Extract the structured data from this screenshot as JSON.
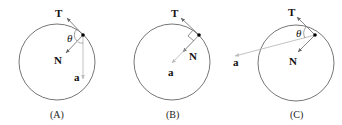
{
  "diagrams": [
    {
      "caption": "(A)",
      "labels": {
        "tension": "T",
        "normal": "N",
        "acceleration": "a",
        "angle": "θ"
      }
    },
    {
      "caption": "(B)",
      "labels": {
        "tension": "T",
        "normal": "N",
        "acceleration": "a"
      }
    },
    {
      "caption": "(C)",
      "labels": {
        "tension": "T",
        "normal": "N",
        "acceleration": "a",
        "angle": "θ"
      }
    }
  ],
  "colors": {
    "circle": "#555555",
    "vector": "#777777",
    "accel": "#aaaaaa",
    "point": "#000000"
  }
}
